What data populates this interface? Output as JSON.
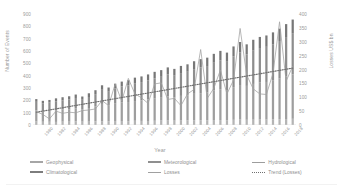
{
  "chart_data": {
    "type": "bar",
    "title": "",
    "subtitle": "",
    "xlabel": "Year",
    "ylabel": "Number of Events",
    "ylabel_secondary": "Losses US$ bn",
    "ylim": [
      0,
      900
    ],
    "ylim_secondary": [
      0,
      400
    ],
    "yticks": [
      900,
      800,
      700,
      600,
      500,
      400,
      300,
      200,
      100,
      0
    ],
    "yticks_secondary": [
      400,
      350,
      300,
      250,
      200,
      150,
      100,
      50,
      0
    ],
    "grid": false,
    "legend_position": "bottom",
    "stacked": true,
    "categories": [
      "1980",
      "1981",
      "1982",
      "1983",
      "1984",
      "1985",
      "1986",
      "1987",
      "1988",
      "1989",
      "1990",
      "1991",
      "1992",
      "1993",
      "1994",
      "1995",
      "1996",
      "1997",
      "1998",
      "1999",
      "2000",
      "2001",
      "2002",
      "2003",
      "2004",
      "2005",
      "2006",
      "2007",
      "2008",
      "2009",
      "2010",
      "2011",
      "2012",
      "2013",
      "2014",
      "2015",
      "2016",
      "2017",
      "2018",
      "2019"
    ],
    "xtick_labels": [
      "1980",
      "1982",
      "1984",
      "1986",
      "1988",
      "1990",
      "1992",
      "1994",
      "1996",
      "1998",
      "2000",
      "2002",
      "2004",
      "2006",
      "2008",
      "2010",
      "2012",
      "2014",
      "2016",
      "2018"
    ],
    "series": [
      {
        "name": "Geophysical",
        "axis": "left",
        "color": "#b4b4b4",
        "values": [
          28,
          26,
          26,
          25,
          27,
          27,
          29,
          27,
          27,
          30,
          31,
          30,
          32,
          32,
          31,
          34,
          33,
          32,
          34,
          36,
          36,
          35,
          36,
          37,
          38,
          38,
          38,
          40,
          40,
          38,
          42,
          44,
          42,
          43,
          44,
          44,
          45,
          46,
          48,
          50
        ]
      },
      {
        "name": "Meteorological",
        "axis": "left",
        "color": "#9e9e9e",
        "values": [
          90,
          85,
          88,
          95,
          98,
          100,
          105,
          98,
          110,
          120,
          140,
          130,
          145,
          150,
          155,
          160,
          165,
          175,
          180,
          185,
          195,
          190,
          200,
          205,
          215,
          220,
          225,
          240,
          250,
          245,
          265,
          280,
          275,
          290,
          300,
          305,
          315,
          330,
          345,
          360
        ]
      },
      {
        "name": "Hydrological",
        "axis": "left",
        "color": "#8d8d8d",
        "values": [
          70,
          65,
          68,
          72,
          75,
          80,
          85,
          80,
          90,
          100,
          115,
          110,
          120,
          130,
          135,
          145,
          150,
          155,
          165,
          170,
          180,
          175,
          185,
          190,
          200,
          210,
          215,
          225,
          235,
          230,
          250,
          265,
          255,
          270,
          280,
          285,
          295,
          305,
          320,
          335
        ]
      },
      {
        "name": "Climatological",
        "axis": "left",
        "color": "#777777",
        "values": [
          22,
          20,
          21,
          24,
          25,
          26,
          28,
          26,
          30,
          32,
          36,
          34,
          38,
          40,
          42,
          45,
          46,
          48,
          52,
          54,
          56,
          55,
          58,
          60,
          64,
          66,
          68,
          72,
          76,
          74,
          80,
          84,
          82,
          88,
          90,
          92,
          96,
          100,
          105,
          110
        ]
      },
      {
        "name": "Losses",
        "axis": "right",
        "color": "#a0a0a0",
        "type": "line",
        "values": [
          48,
          38,
          22,
          50,
          42,
          46,
          44,
          52,
          54,
          58,
          88,
          70,
          148,
          86,
          168,
          112,
          98,
          78,
          148,
          152,
          92,
          96,
          70,
          112,
          128,
          272,
          96,
          132,
          198,
          112,
          162,
          348,
          180,
          130,
          112,
          110,
          186,
          372,
          158,
          212
        ]
      },
      {
        "name": "Trend (Losses)",
        "axis": "right",
        "color": "#6f6f6f",
        "type": "dotted-trend",
        "values": [
          46,
          50,
          54,
          58,
          62,
          66,
          70,
          74,
          78,
          82,
          86,
          90,
          94,
          98,
          102,
          106,
          110,
          114,
          118,
          122,
          126,
          130,
          134,
          138,
          142,
          146,
          150,
          154,
          158,
          162,
          166,
          170,
          174,
          178,
          182,
          186,
          190,
          194,
          198,
          205
        ]
      }
    ],
    "legend": [
      {
        "label": "Geophysical",
        "style": "bar"
      },
      {
        "label": "Meteorological",
        "style": "bar"
      },
      {
        "label": "Hydrological",
        "style": "bar"
      },
      {
        "label": "Climatological",
        "style": "bar"
      },
      {
        "label": "Losses",
        "style": "line"
      },
      {
        "label": "Trend (Losses)",
        "style": "dotted"
      }
    ]
  }
}
